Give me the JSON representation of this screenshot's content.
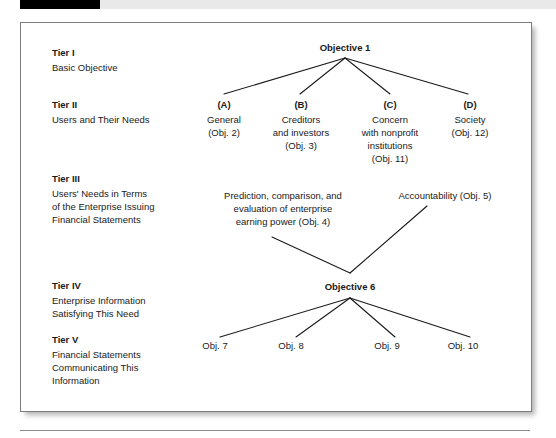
{
  "exhibit": {
    "tiers": [
      {
        "name": "Tier I",
        "desc_lines": [
          "Basic Objective"
        ]
      },
      {
        "name": "Tier II",
        "desc_lines": [
          "Users and Their Needs"
        ]
      },
      {
        "name": "Tier III",
        "desc_lines": [
          "Users' Needs in Terms",
          "of the Enterprise Issuing",
          "Financial Statements"
        ]
      },
      {
        "name": "Tier IV",
        "desc_lines": [
          "Enterprise Information",
          "Satisfying This Need"
        ]
      },
      {
        "name": "Tier V",
        "desc_lines": [
          "Financial Statements",
          "Communicating This",
          "Information"
        ]
      }
    ],
    "tier1": {
      "root_label": "Objective 1"
    },
    "tier2": {
      "nodes": [
        {
          "key": "(A)",
          "lines": [
            "General",
            "(Obj. 2)"
          ]
        },
        {
          "key": "(B)",
          "lines": [
            "Creditors",
            "and investors",
            "(Obj. 3)"
          ]
        },
        {
          "key": "(C)",
          "lines": [
            "Concern",
            "with nonprofit",
            "institutions",
            "(Obj. 11)"
          ]
        },
        {
          "key": "(D)",
          "lines": [
            "Society",
            "(Obj. 12)"
          ]
        }
      ]
    },
    "tier3": {
      "need_left_lines": [
        "Prediction, comparison, and",
        "evaluation of enterprise",
        "earning power (Obj. 4)"
      ],
      "need_right_lines": [
        "Accountability (Obj. 5)"
      ]
    },
    "tier4": {
      "node_label": "Objective 6"
    },
    "tier5": {
      "nodes": [
        "Obj. 7",
        "Obj. 8",
        "Obj. 9",
        "Obj. 10"
      ]
    },
    "colors": {
      "line": "#1a1a1a",
      "text": "#1a1a1a",
      "frame_border": "#7d7d7d",
      "bar_black": "#000000",
      "bar_gray": "#e9e9e9"
    }
  }
}
